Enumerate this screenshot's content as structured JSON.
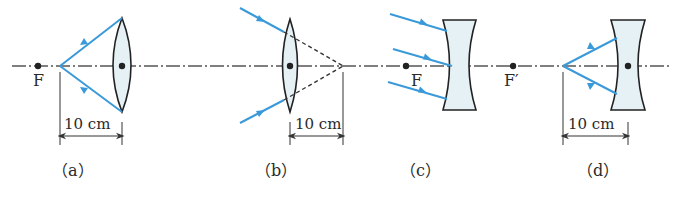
{
  "colors": {
    "ray": "#3a9ad9",
    "line": "#333333",
    "lens_fill": "#e6f1f6",
    "axis": "#555555",
    "dot": "#222222"
  },
  "axis": {
    "y": 66,
    "x_start": 12,
    "x_end": 672
  },
  "panels": [
    {
      "id": "a",
      "caption": "（a）",
      "lens_type": "convex",
      "focal_label": "F",
      "dimension_label": "10 cm",
      "description": "Two rays diverge from a point 10 cm left of a convex lens; focal point F lies further left"
    },
    {
      "id": "b",
      "caption": "（b）",
      "lens_type": "convex",
      "dimension_label": "10 cm",
      "description": "Two converging rays hit convex lens; dashed extensions meet 10 cm right of the lens"
    },
    {
      "id": "c",
      "caption": "（c）",
      "lens_type": "concave",
      "focal_label_left": "F",
      "focal_label_right": "F′",
      "description": "Three parallel oblique rays strike a concave lens with focal points F and F′"
    },
    {
      "id": "d",
      "caption": "（d）",
      "lens_type": "concave",
      "dimension_label": "10 cm",
      "description": "Two rays diverge from a point 10 cm left of a concave lens"
    }
  ]
}
